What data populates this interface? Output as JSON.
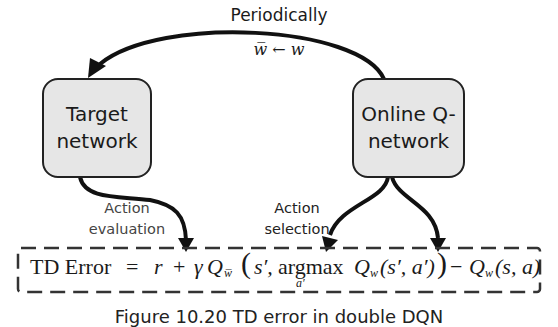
{
  "diagram": {
    "title_arrow": {
      "label": "Periodically",
      "update_rule": "w̅ ← w"
    },
    "nodes": [
      {
        "id": "target",
        "line1": "Target",
        "line2": "network"
      },
      {
        "id": "online",
        "line1": "Online Q-",
        "line2": "network"
      }
    ],
    "edge_labels": {
      "evaluation_1": "Action",
      "evaluation_2": "evaluation",
      "selection_1": "Action",
      "selection_2": "selection"
    },
    "formula": {
      "lhs": "TD Error",
      "eq": "=",
      "r": "r",
      "plus": "+",
      "gamma": "γ",
      "q_target": "Q",
      "q_target_sub": "w̅",
      "open": "(",
      "s_prime": "s′,",
      "argmax": "argmax",
      "argmax_sub": "a′",
      "q_online": "Q",
      "q_online_sub": "w",
      "args_online": "(s′, a′)",
      "close": ")",
      "minus": "−",
      "q_sa": "Q",
      "q_sa_sub": "w",
      "args_sa": "(s, a)"
    },
    "caption": "Figure 10.20 TD error in double DQN"
  }
}
